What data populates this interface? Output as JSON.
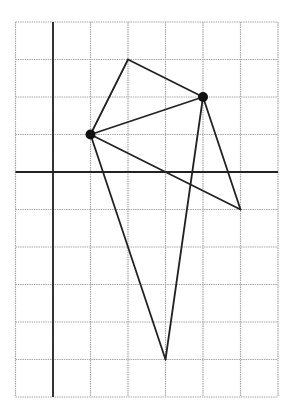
{
  "diagram": {
    "type": "coordinate-grid-figure",
    "grid": {
      "origin_px": [
        53,
        172
      ],
      "cell_px": 37.5,
      "x_range": [
        -1,
        6
      ],
      "y_range": [
        -6,
        4
      ],
      "grid_color": "#a8a8a8",
      "axis_color": "#222222",
      "line_color": "#222222"
    },
    "points": [
      {
        "id": "A",
        "x": 1,
        "y": 1,
        "dot": true
      },
      {
        "id": "B",
        "x": 2,
        "y": 3,
        "dot": false
      },
      {
        "id": "C",
        "x": 4,
        "y": 2,
        "dot": true
      },
      {
        "id": "D",
        "x": 5,
        "y": -1,
        "dot": false
      },
      {
        "id": "E",
        "x": 3,
        "y": -5,
        "dot": false
      }
    ],
    "segments": [
      [
        "A",
        "B"
      ],
      [
        "B",
        "C"
      ],
      [
        "A",
        "C"
      ],
      [
        "A",
        "D"
      ],
      [
        "C",
        "D"
      ],
      [
        "A",
        "E"
      ],
      [
        "C",
        "E"
      ]
    ]
  }
}
